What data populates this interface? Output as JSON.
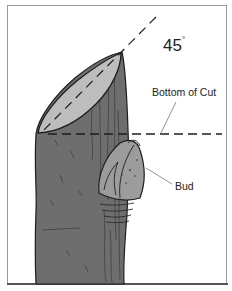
{
  "figure": {
    "labels": {
      "angle_value": "45",
      "angle_unit": "°",
      "bottom_of_cut": "Bottom of Cut",
      "bud": "Bud"
    },
    "colors": {
      "stem": "#6e6e6e",
      "stem_dark": "#3a3a3a",
      "cut_face": "#bdbdbd",
      "bud": "#9c9c9c",
      "outline": "#1e1e1e",
      "frame": "#9a9a9a"
    },
    "annotations": {
      "angle_guide": "dashed diagonal line at 45 degrees through the cut face",
      "bottom_of_cut_guide": "dashed horizontal line at the lowest point of the cut"
    }
  }
}
